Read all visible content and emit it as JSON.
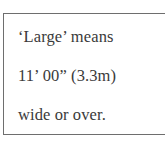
{
  "note": {
    "lines": [
      "‘Large’ means",
      "11’ 00” (3.3m)",
      "wide or over."
    ]
  },
  "colors": {
    "text": "#3a3a3a",
    "border": "#6e6e6e",
    "background": "#ffffff"
  }
}
